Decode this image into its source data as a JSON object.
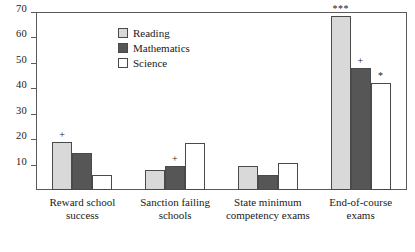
{
  "chart_data": {
    "type": "bar",
    "title": "",
    "xlabel": "",
    "ylabel": "",
    "ylim": [
      0,
      70
    ],
    "ytick_values": [
      10,
      20,
      30,
      40,
      50,
      60,
      70
    ],
    "ytick_labels": [
      "10",
      "20",
      "30",
      "40",
      "50",
      "60",
      "70"
    ],
    "grid": false,
    "legend_position": "top-center-left",
    "categories": [
      "Reward school success",
      "Sanction failing schools",
      "State minimum competency exams",
      "End-of-course exams"
    ],
    "category_lines": [
      [
        "Reward school",
        "success"
      ],
      [
        "Sanction failing",
        "schools"
      ],
      [
        "State minimum",
        "competency exams"
      ],
      [
        "End-of-course",
        "exams"
      ]
    ],
    "series": [
      {
        "name": "Reading",
        "color": "#d9d9d9",
        "values": [
          19,
          8,
          9.5,
          68.5
        ],
        "significance": [
          "+",
          "",
          "",
          "***"
        ]
      },
      {
        "name": "Mathematics",
        "color": "#565656",
        "values": [
          14.5,
          9.5,
          6,
          48
        ],
        "significance": [
          "",
          "+",
          "",
          "+"
        ]
      },
      {
        "name": "Science",
        "color": "#ffffff",
        "values": [
          6,
          18.5,
          10.5,
          42
        ],
        "significance": [
          "",
          "",
          "",
          "*"
        ]
      }
    ]
  },
  "legend": {
    "entries": [
      {
        "label": "Reading",
        "color": "#d9d9d9"
      },
      {
        "label": "Mathematics",
        "color": "#565656"
      },
      {
        "label": "Science",
        "color": "#ffffff"
      }
    ]
  },
  "colors": {
    "reading": "#d9d9d9",
    "mathematics": "#565656",
    "science": "#ffffff",
    "axis": "#5a5a5a",
    "bar_outline": "#4a4a4a",
    "text": "#1a1a1a"
  }
}
